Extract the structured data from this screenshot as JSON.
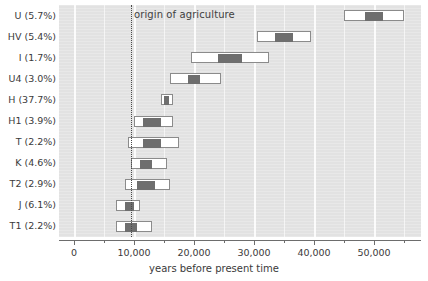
{
  "chart_data": {
    "type": "bar",
    "orientation": "horizontal",
    "title": "",
    "xlabel": "years before present time",
    "ylabel": "",
    "xlim": [
      0,
      55500
    ],
    "ylim": [
      0,
      11
    ],
    "grid": true,
    "legend": null,
    "xticks": [
      0,
      10000,
      20000,
      30000,
      40000,
      50000
    ],
    "xticklabels": [
      "0",
      "10,000",
      "20,000",
      "30,000",
      "40,000",
      "50,000"
    ],
    "xtick_minor_step": 5000,
    "categories": [
      "U (5.7%)",
      "HV (5.4%)",
      "I (1.7%)",
      "U4 (3.0%)",
      "H (37.7%)",
      "H1 (3.9%)",
      "T (2.2%)",
      "K (4.6%)",
      "T2 (2.9%)",
      "J (6.1%)",
      "T1 (2.2%)"
    ],
    "series": [
      {
        "name": "confidence interval",
        "kind": "range-outer",
        "values": [
          {
            "label": "U (5.7%)",
            "low": 45000,
            "high": 55000
          },
          {
            "label": "HV (5.4%)",
            "low": 30500,
            "high": 39500
          },
          {
            "label": "I (1.7%)",
            "low": 19500,
            "high": 32500
          },
          {
            "label": "U4 (3.0%)",
            "local_note": "",
            "low": 16000,
            "high": 24500
          },
          {
            "label": "H (37.7%)",
            "low": 14500,
            "high": 16500
          },
          {
            "label": "H1 (3.9%)",
            "low": 10000,
            "high": 16500
          },
          {
            "label": "T (2.2%)",
            "low": 9000,
            "high": 17500
          },
          {
            "label": "K (4.6%)",
            "low": 9500,
            "high": 15500
          },
          {
            "label": "T2 (2.9%)",
            "low": 8500,
            "high": 16000
          },
          {
            "label": "J (6.1%)",
            "low": 7000,
            "high": 11000
          },
          {
            "label": "T1 (2.2%)",
            "low": 7000,
            "high": 13000
          }
        ]
      },
      {
        "name": "point estimate range",
        "kind": "range-inner",
        "values": [
          {
            "label": "U (5.7%)",
            "low": 48500,
            "high": 51500
          },
          {
            "label": "HV (5.4%)",
            "low": 33500,
            "high": 36500
          },
          {
            "label": "I (1.7%)",
            "low": 24000,
            "high": 28000
          },
          {
            "label": "U4 (3.0%)",
            "low": 19000,
            "high": 21000
          },
          {
            "label": "H (37.7%)",
            "low": 15000,
            "high": 15800
          },
          {
            "label": "H1 (3.9%)",
            "low": 11500,
            "high": 14500
          },
          {
            "label": "T (2.2%)",
            "low": 11500,
            "high": 14500
          },
          {
            "label": "K (4.6%)",
            "low": 11000,
            "high": 13000
          },
          {
            "label": "T2 (2.9%)",
            "low": 10500,
            "high": 13500
          },
          {
            "label": "J (6.1%)",
            "low": 8500,
            "high": 10000
          },
          {
            "label": "T1 (2.2%)",
            "low": 8500,
            "high": 10500
          }
        ]
      }
    ],
    "annotations": [
      {
        "name": "origin-of-agriculture",
        "text": "origin of agriculture",
        "x": 9500,
        "style": "dotted vertical line"
      }
    ],
    "colors": {
      "panel_background": "#e2e2e2",
      "gridline": "#f6f6f6",
      "bar_outer_fill": "#ffffff",
      "bar_outer_stroke": "#8b8b8b",
      "bar_inner_fill": "#6e6e6e",
      "axis": "#6d6d6d",
      "text": "#3a3a3a",
      "annotation_line": "#4a4a4a"
    }
  }
}
